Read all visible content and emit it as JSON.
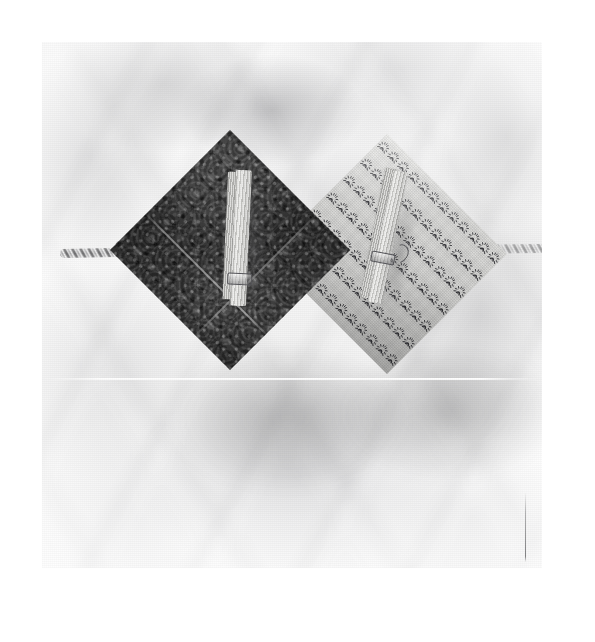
{
  "image": {
    "title": "Two fabric swatches pegged on a twine line",
    "medium": "black-and-white photograph",
    "orientation": "portrait",
    "canvas": {
      "width": 595,
      "height": 642,
      "background_color": "#ffffff"
    },
    "plate": {
      "x": 42,
      "y": 42,
      "width": 500,
      "height": 526,
      "background_color": "#f7f7f7"
    }
  },
  "scene": {
    "background": {
      "name": "crumpled-white-cloth-backdrop",
      "description": "soft out-of-focus white fabric with diagonal drapery folds and grey shadows",
      "tone_light": "#fbfbfb",
      "tone_mid": "#d6d6d8",
      "tone_shadow": "#9a9a9d"
    },
    "line": {
      "name": "twine-clothesline",
      "description": "twisted natural twine stretched horizontally across the frame",
      "y": 252,
      "left_end_x": 62,
      "right_end_x": 556,
      "knot_x": 118,
      "color": "#8d8d8f"
    },
    "swatches": [
      {
        "name": "dark-damask-swatch",
        "position": "left",
        "rotation_deg": 45,
        "tone": "very dark charcoal",
        "color": "#2b2b2b",
        "pattern": "dense damask / scroll floral brocade",
        "top_corner": {
          "x": 233,
          "y": 250
        },
        "left_corner": {
          "x": 92,
          "y": 357
        },
        "right_corner": {
          "x": 340,
          "y": 357
        },
        "bottom_corner": {
          "x": 233,
          "y": 489
        }
      },
      {
        "name": "light-fan-print-swatch",
        "position": "right",
        "rotation_deg": 45,
        "tone": "light grey-cream",
        "color": "#e2e2e0",
        "ink_color": "#3a3a3c",
        "pattern": "repeating fan / sunburst motif with small arch and radiating dashes",
        "top_corner": {
          "x": 399,
          "y": 249
        },
        "left_corner": {
          "x": 287,
          "y": 362
        },
        "right_corner": {
          "x": 527,
          "y": 365
        },
        "bottom_corner": {
          "x": 387,
          "y": 471
        }
      }
    ],
    "clothespins": [
      {
        "name": "clothespin-left",
        "material": "weathered wood",
        "color": "#cfcfcc",
        "tilt_deg": 3,
        "top": {
          "x": 232,
          "y": 172
        },
        "bottom": {
          "x": 238,
          "y": 305
        },
        "spring_y": 242,
        "clips": "dark-damask-swatch"
      },
      {
        "name": "clothespin-right",
        "material": "weathered wood",
        "color": "#c7c7c4",
        "tilt_deg": 11,
        "top": {
          "x": 381,
          "y": 171
        },
        "bottom": {
          "x": 406,
          "y": 300
        },
        "spring_y": 258,
        "clips": "light-fan-print-swatch"
      }
    ],
    "artifacts": [
      {
        "name": "scan-seam-horizontal",
        "y": 378,
        "description": "faint pale horizontal scanner seam across the plate"
      },
      {
        "name": "scan-seam-vertical",
        "x": 525,
        "y_start": 495,
        "y_end": 562,
        "description": "thin dark vertical mark near the lower right edge"
      }
    ]
  },
  "caption": {
    "alt_text": "Black-and-white photo of two square fabric swatches hung point-down from wooden clothespins on a length of twine; the left swatch is dark damask, the right is a pale fan-print."
  }
}
